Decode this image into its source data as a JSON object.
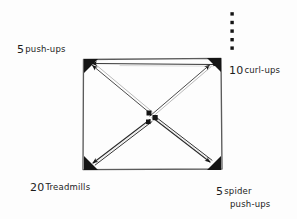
{
  "diagram": {
    "ink_color": "#1a1a1a",
    "background_color": "#fdfdfd",
    "stations": [
      {
        "id": "top-left",
        "quantity": "5",
        "exercise": "push-ups",
        "corner": "top-left"
      },
      {
        "id": "top-right",
        "quantity": "10",
        "exercise": "curl-ups",
        "corner": "top-right"
      },
      {
        "id": "bottom-left",
        "quantity": "20",
        "exercise": "Treadmills",
        "corner": "bottom-left"
      },
      {
        "id": "bottom-right",
        "quantity": "5",
        "exercise": "spider",
        "exercise_line2": "push-ups",
        "corner": "bottom-right"
      }
    ],
    "shapes": {
      "square": {
        "x": 82,
        "y": 58,
        "width": 140,
        "height": 112
      },
      "corner_markers": 4,
      "center_markers": 3,
      "dot_column": {
        "x": 232,
        "count": 5,
        "y_start": 13,
        "y_end": 47
      }
    },
    "arrows": [
      {
        "name": "center-to-top-left",
        "from": "center",
        "to": "top-left"
      },
      {
        "name": "center-to-top-right",
        "from": "center",
        "to": "top-right"
      },
      {
        "name": "center-to-bottom-left",
        "from": "center",
        "to": "bottom-left"
      },
      {
        "name": "center-to-bottom-right",
        "from": "center",
        "to": "bottom-right"
      },
      {
        "name": "top-edge-right-to-left",
        "from": "top-right",
        "to": "top-left"
      }
    ]
  }
}
